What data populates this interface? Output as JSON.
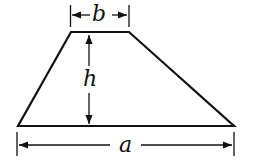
{
  "diagram": {
    "shape": "trapezoid",
    "labels": {
      "top_base": "b",
      "height": "h",
      "bottom_base": "a"
    },
    "colors": {
      "stroke": "#111111",
      "background": "#ffffff"
    }
  }
}
